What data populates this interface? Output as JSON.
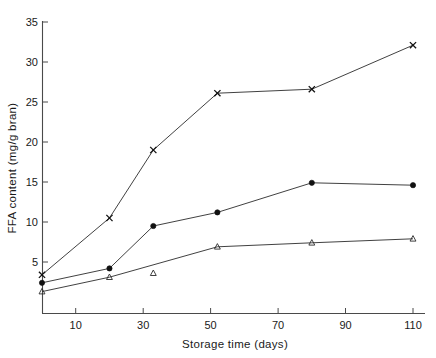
{
  "chart_data": {
    "type": "line",
    "title": "",
    "subtitle": "",
    "xlabel": "Storage time (days)",
    "ylabel": "FFA content (mg/g bran)",
    "xlim": [
      0,
      115
    ],
    "ylim": [
      0,
      35
    ],
    "xticks": [
      10,
      30,
      50,
      70,
      90,
      110
    ],
    "xticklabels": [
      "10",
      "30",
      "50",
      "70",
      "90",
      "110"
    ],
    "yticks": [
      5,
      10,
      15,
      20,
      25,
      30,
      35
    ],
    "yticklabels": [
      "5",
      "10",
      "15",
      "20",
      "25",
      "30",
      "35"
    ],
    "grid": false,
    "legend": "none",
    "series": [
      {
        "name": "series-cross",
        "marker": "x",
        "x": [
          0,
          20,
          33,
          52,
          80,
          110
        ],
        "values": [
          3.4,
          10.5,
          19.0,
          26.1,
          26.6,
          32.1
        ]
      },
      {
        "name": "series-filled-circle",
        "marker": "filled-circle",
        "x": [
          0,
          20,
          33,
          52,
          80,
          110
        ],
        "values": [
          2.4,
          4.2,
          9.5,
          11.2,
          14.9,
          14.6
        ]
      },
      {
        "name": "series-open-triangle",
        "marker": "open-triangle",
        "x": [
          0,
          20,
          52,
          80,
          110
        ],
        "values": [
          1.3,
          3.1,
          6.9,
          7.4,
          7.9
        ]
      }
    ],
    "extra_points": [
      {
        "name": "isolated-triangle",
        "marker": "open-triangle",
        "x": 33,
        "value": 3.6
      }
    ]
  },
  "axes": {
    "x_title": "Storage time (days)",
    "y_title": "FFA content (mg/g bran)"
  }
}
